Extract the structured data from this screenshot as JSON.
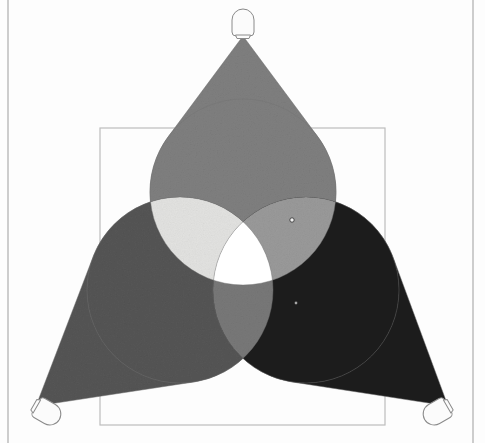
{
  "figure": {
    "canvas": {
      "width": 485,
      "height": 443,
      "background": "#fdfdfd"
    },
    "outer_frame": {
      "name": "outer-page-rule",
      "left_x": 8,
      "right_x": 473,
      "top_y": 0,
      "bottom_y": 443,
      "color": "#b8b8b8",
      "stroke_width": 1.4
    },
    "inner_frame": {
      "name": "projection-screen-square",
      "x": 100,
      "y": 128,
      "width": 285,
      "height": 297,
      "color": "#bdbdbd",
      "stroke_width": 1.2,
      "fill": "none"
    },
    "colors": {
      "paper": "#fdfdfd",
      "beam_top": "#7f7f7f",
      "beam_left": "#555555",
      "beam_right": "#1c1c1c",
      "overlap_top_left": "#e3e3e1",
      "overlap_top_right": "#9a9a9a",
      "overlap_left_right": "#787878",
      "overlap_all_three": "#ffffff",
      "edge_stroke": "#6f6f6f",
      "lamp_body": "#fbfbfb",
      "lamp_outline": "#8a8a8a"
    },
    "lamps": [
      {
        "id": "lamp-top",
        "label": "top lamp",
        "x": 243,
        "y": 36,
        "angle_deg": 0,
        "beam_target_circle": "circle-top"
      },
      {
        "id": "lamp-left",
        "label": "bottom-left lamp",
        "x": 36,
        "y": 406,
        "angle_deg": 120,
        "beam_target_circle": "circle-left"
      },
      {
        "id": "lamp-right",
        "label": "bottom-right lamp",
        "x": 448,
        "y": 406,
        "angle_deg": -120,
        "beam_target_circle": "circle-right"
      }
    ],
    "circles": [
      {
        "id": "circle-top",
        "label": "top light pool",
        "cx": 243,
        "cy": 192,
        "r": 93,
        "fill_key": "beam_top"
      },
      {
        "id": "circle-left",
        "label": "bottom-left light pool",
        "cx": 180,
        "cy": 290,
        "r": 93,
        "fill_key": "beam_left"
      },
      {
        "id": "circle-right",
        "label": "bottom-right light pool",
        "cx": 306,
        "cy": 290,
        "r": 93,
        "fill_key": "beam_right"
      }
    ],
    "markers": [
      {
        "id": "marker-top-right-rim",
        "x": 292,
        "y": 220,
        "r": 2.2,
        "label": "rim marker"
      },
      {
        "id": "marker-right-field",
        "x": 296,
        "y": 303,
        "r": 1.4,
        "label": "field marker"
      }
    ]
  }
}
